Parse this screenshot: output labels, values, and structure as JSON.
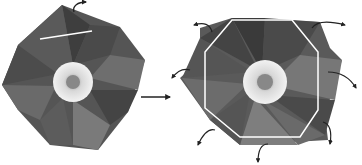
{
  "diagram": {
    "type": "origami-folding-step",
    "steps": [
      {
        "id": "before",
        "description": "Folded flower with white line marking fold",
        "center": [
          73,
          80
        ],
        "fold_line": {
          "x1": 40,
          "y1": 39,
          "x2": 92,
          "y2": 31,
          "color": "#ffffff"
        }
      },
      {
        "id": "after",
        "description": "Flower unfolded with octagon outline and outward arrows",
        "center": [
          265,
          82
        ],
        "outline_color": "#ffffff",
        "arrow_count": 8
      }
    ],
    "transition_arrow": {
      "from": "before",
      "to": "after",
      "color": "#222222"
    },
    "colors": {
      "paper_dark": "#3a3a3a",
      "paper_mid": "#6a6a6a",
      "paper_light": "#9a9a9a",
      "center": "#e6e6e6",
      "background": "#ffffff"
    }
  }
}
